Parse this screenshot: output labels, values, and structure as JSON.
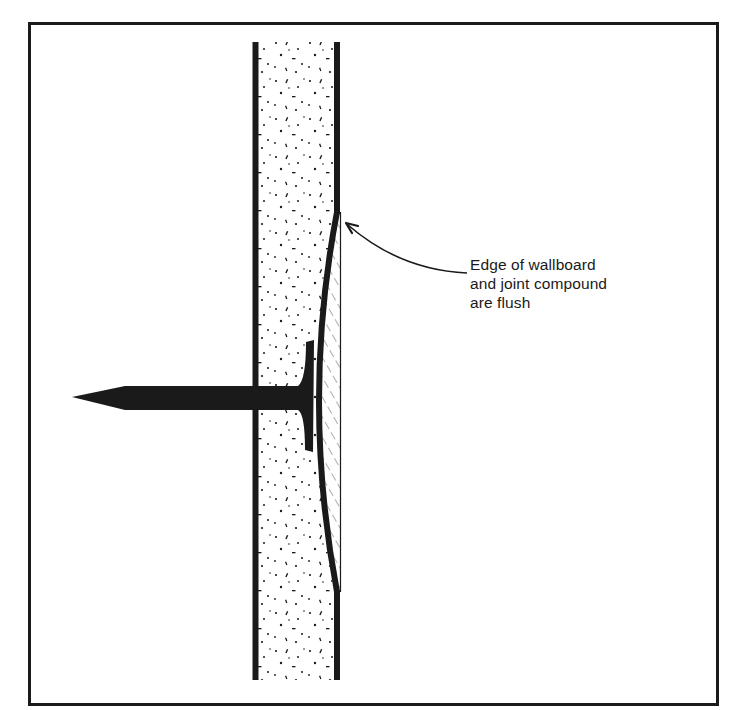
{
  "figure": {
    "type": "cross-section",
    "colors": {
      "ink": "#1a1a1a",
      "background": "#ffffff"
    }
  },
  "callout": {
    "lines": [
      "Edge of wallboard",
      "and joint compound",
      "are flush"
    ]
  },
  "parts": {
    "wallboard": "gypsum-core-stippled",
    "nail": "nail-with-head",
    "compound": "joint-compound-hatched",
    "leader": "callout-arrow"
  }
}
